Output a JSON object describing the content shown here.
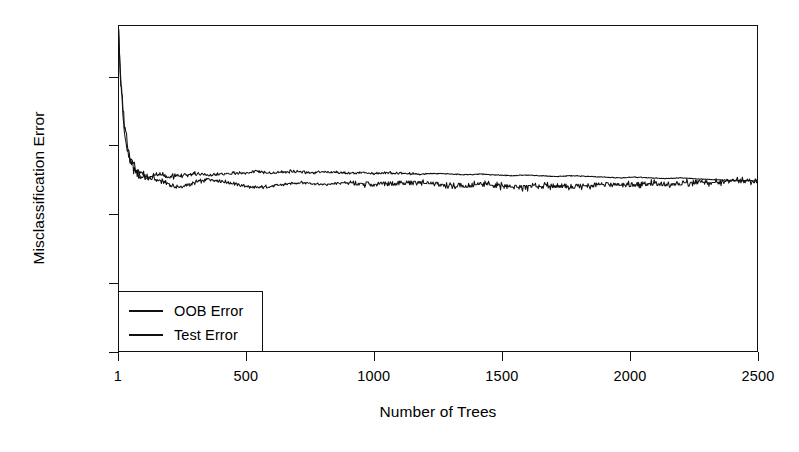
{
  "chart_data": {
    "type": "line",
    "title": "",
    "xlabel": "Number of Trees",
    "ylabel": "Misclassification Error",
    "xlim": [
      1,
      2500
    ],
    "ylim": [
      0.0,
      0.095
    ],
    "grid": false,
    "legend_position": "bottom-left",
    "xticks": [
      {
        "value": 1,
        "label": "1"
      },
      {
        "value": 500,
        "label": "500"
      },
      {
        "value": 1000,
        "label": "1000"
      },
      {
        "value": 1500,
        "label": "1500"
      },
      {
        "value": 2000,
        "label": "2000"
      },
      {
        "value": 2500,
        "label": "2500"
      }
    ],
    "yticks": [
      {
        "value": 0.0,
        "label": "0.00"
      },
      {
        "value": 0.02,
        "label": "0.02"
      },
      {
        "value": 0.04,
        "label": "0.04"
      },
      {
        "value": 0.06,
        "label": "0.06"
      },
      {
        "value": 0.08,
        "label": "0.08"
      }
    ],
    "series": [
      {
        "name": "OOB Error",
        "color": "#111111",
        "x": [
          1,
          10,
          20,
          30,
          40,
          50,
          60,
          70,
          80,
          90,
          100,
          120,
          140,
          160,
          180,
          200,
          220,
          240,
          260,
          280,
          300,
          330,
          360,
          390,
          420,
          450,
          480,
          510,
          540,
          570,
          600,
          640,
          680,
          720,
          760,
          800,
          850,
          900,
          950,
          1000,
          1060,
          1120,
          1180,
          1240,
          1300,
          1360,
          1420,
          1480,
          1540,
          1600,
          1660,
          1720,
          1780,
          1840,
          1900,
          1960,
          2020,
          2080,
          2140,
          2200,
          2260,
          2320,
          2380,
          2440,
          2500
        ],
        "values": [
          0.095,
          0.0805,
          0.0685,
          0.0618,
          0.0578,
          0.0552,
          0.0534,
          0.0523,
          0.0516,
          0.0511,
          0.0508,
          0.0503,
          0.0506,
          0.0498,
          0.0493,
          0.0487,
          0.0482,
          0.0478,
          0.0481,
          0.0486,
          0.0492,
          0.0497,
          0.0502,
          0.0499,
          0.0494,
          0.049,
          0.0485,
          0.048,
          0.0477,
          0.0479,
          0.0483,
          0.0486,
          0.049,
          0.0492,
          0.0489,
          0.0486,
          0.0489,
          0.0492,
          0.049,
          0.0487,
          0.0489,
          0.0492,
          0.049,
          0.0488,
          0.0486,
          0.0484,
          0.0487,
          0.0483,
          0.0479,
          0.0478,
          0.0481,
          0.0484,
          0.0481,
          0.0484,
          0.0487,
          0.0484,
          0.0487,
          0.049,
          0.0488,
          0.0491,
          0.0494,
          0.0492,
          0.0496,
          0.0497,
          0.0497
        ]
      },
      {
        "name": "Test Error",
        "color": "#111111",
        "x": [
          1,
          10,
          20,
          30,
          40,
          50,
          60,
          70,
          80,
          90,
          100,
          120,
          140,
          160,
          180,
          200,
          220,
          240,
          260,
          280,
          300,
          330,
          360,
          390,
          420,
          450,
          480,
          510,
          540,
          570,
          600,
          640,
          680,
          720,
          760,
          800,
          850,
          900,
          950,
          1000,
          1060,
          1120,
          1180,
          1240,
          1300,
          1360,
          1420,
          1480,
          1540,
          1600,
          1660,
          1720,
          1780,
          1840,
          1900,
          1960,
          2020,
          2080,
          2140,
          2200,
          2260,
          2320,
          2380,
          2440,
          2500
        ],
        "values": [
          0.095,
          0.0826,
          0.0706,
          0.0635,
          0.0592,
          0.0563,
          0.0544,
          0.0532,
          0.0524,
          0.0519,
          0.0515,
          0.051,
          0.0513,
          0.0516,
          0.0512,
          0.0508,
          0.0511,
          0.0514,
          0.0512,
          0.0515,
          0.0518,
          0.0516,
          0.0513,
          0.0516,
          0.0519,
          0.0521,
          0.0519,
          0.0522,
          0.0525,
          0.0523,
          0.052,
          0.0522,
          0.0525,
          0.0523,
          0.0521,
          0.0524,
          0.0522,
          0.0519,
          0.0521,
          0.0519,
          0.0521,
          0.0519,
          0.0517,
          0.0519,
          0.0517,
          0.0515,
          0.0517,
          0.0514,
          0.0512,
          0.0514,
          0.0512,
          0.051,
          0.0512,
          0.051,
          0.0508,
          0.0506,
          0.0508,
          0.0506,
          0.0504,
          0.0506,
          0.0503,
          0.0501,
          0.0499,
          0.0498,
          0.0497
        ]
      }
    ]
  },
  "legend": {
    "entries": [
      {
        "label": "OOB Error"
      },
      {
        "label": "Test Error"
      }
    ]
  }
}
